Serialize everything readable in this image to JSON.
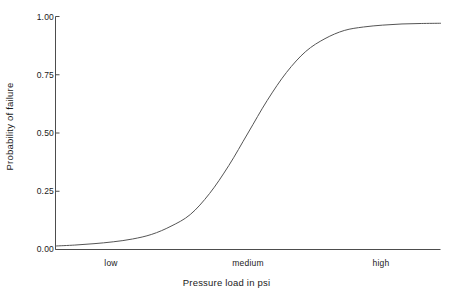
{
  "chart_data": {
    "type": "line",
    "title": "",
    "subtitle": "",
    "xlabel": "Pressure load in psi",
    "ylabel": "Probability of failure",
    "xlim": [
      0,
      10
    ],
    "ylim": [
      0.0,
      1.0
    ],
    "grid": false,
    "legend": null,
    "legend_position": "none",
    "x_tick_labels": [
      "low",
      "medium",
      "high"
    ],
    "x_tick_values": [
      1.45,
      5.0,
      8.45
    ],
    "y_tick_labels": [
      "0.00",
      "0.25",
      "0.50",
      "0.75",
      "1.00"
    ],
    "y_tick_values": [
      0.0,
      0.25,
      0.5,
      0.75,
      1.0
    ],
    "series": [
      {
        "name": "Probability of failure",
        "color": "#555555",
        "x": [
          0.0,
          0.5,
          1.0,
          1.5,
          2.0,
          2.5,
          3.0,
          3.5,
          4.0,
          4.5,
          5.0,
          5.5,
          6.0,
          6.5,
          7.0,
          7.5,
          8.0,
          8.5,
          9.0,
          9.5,
          10.0
        ],
        "y": [
          0.015,
          0.019,
          0.025,
          0.033,
          0.045,
          0.065,
          0.1,
          0.15,
          0.24,
          0.36,
          0.5,
          0.64,
          0.76,
          0.85,
          0.905,
          0.94,
          0.955,
          0.963,
          0.968,
          0.97,
          0.971
        ]
      }
    ]
  },
  "axis": {
    "y_ticks": [
      {
        "label": "1.00",
        "value": 1.0
      },
      {
        "label": "0.75",
        "value": 0.75
      },
      {
        "label": "0.50",
        "value": 0.5
      },
      {
        "label": "0.25",
        "value": 0.25
      },
      {
        "label": "0.00",
        "value": 0.0
      }
    ],
    "x_categories": [
      {
        "label": "low",
        "value": 1.45
      },
      {
        "label": "medium",
        "value": 5.0
      },
      {
        "label": "high",
        "value": 8.45
      }
    ],
    "x_title": "Pressure load in psi",
    "y_title": "Probability of failure"
  },
  "style": {
    "axis_color": "#4d4d4d",
    "curve_color": "#555555",
    "text_color": "#1a1a1a",
    "background": "#ffffff"
  }
}
